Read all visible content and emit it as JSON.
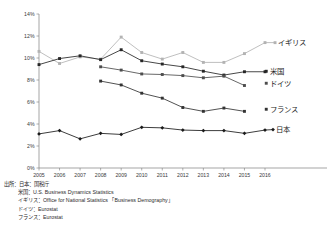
{
  "chart_data": {
    "type": "line",
    "title": "",
    "subtitle": "",
    "xlabel": "",
    "ylabel": "",
    "x": [
      2005,
      2006,
      2007,
      2008,
      2009,
      2010,
      2011,
      2012,
      2013,
      2014,
      2015,
      2016
    ],
    "xtick_labels": [
      "2005",
      "2006",
      "2007",
      "2008",
      "2009",
      "2010",
      "2011",
      "2012",
      "2013",
      "2014",
      "2015",
      "2016"
    ],
    "ytick_labels": [
      "0%",
      "2%",
      "4%",
      "6%",
      "8%",
      "10%",
      "12%",
      "14%"
    ],
    "ytick_values": [
      0,
      2,
      4,
      6,
      8,
      10,
      12,
      14
    ],
    "ylim": [
      0,
      14
    ],
    "xlim": [
      2005,
      2016
    ],
    "grid": false,
    "legend_position": "right-inline-labels",
    "series": [
      {
        "name": "イギリス",
        "label": "イギリス",
        "color": "#b3b3b3",
        "marker": "square",
        "x": [
          2005,
          2006,
          2007,
          2008,
          2009,
          2010,
          2011,
          2012,
          2013,
          2014,
          2015,
          2016
        ],
        "values": [
          10.6,
          9.5,
          10.1,
          9.9,
          11.9,
          10.5,
          9.9,
          10.5,
          9.6,
          9.6,
          10.4,
          11.4
        ]
      },
      {
        "name": "米国",
        "label": "米国",
        "color": "#262626",
        "marker": "square",
        "x": [
          2005,
          2006,
          2007,
          2008,
          2009,
          2010,
          2011,
          2012,
          2013,
          2014,
          2015,
          2016
        ],
        "values": [
          9.4,
          9.95,
          10.2,
          9.85,
          10.75,
          9.75,
          9.45,
          9.2,
          8.8,
          8.45,
          8.75,
          8.75
        ]
      },
      {
        "name": "ドイツ",
        "label": "ドイツ",
        "color": "#4d4d4d",
        "marker": "square",
        "x": [
          2008,
          2009,
          2010,
          2011,
          2012,
          2013,
          2014,
          2015
        ],
        "values": [
          9.2,
          8.9,
          8.55,
          8.5,
          8.4,
          8.2,
          8.35,
          7.5
        ]
      },
      {
        "name": "フランス",
        "label": "フランス",
        "color": "#333333",
        "marker": "square",
        "x": [
          2008,
          2009,
          2010,
          2011,
          2012,
          2013,
          2014,
          2015
        ],
        "values": [
          7.9,
          7.55,
          6.8,
          6.35,
          5.5,
          5.15,
          5.45,
          5.15
        ]
      },
      {
        "name": "日本",
        "label": "日本",
        "color": "#1a1a1a",
        "marker": "diamond",
        "x": [
          2005,
          2006,
          2007,
          2008,
          2009,
          2010,
          2011,
          2012,
          2013,
          2014,
          2015,
          2016
        ],
        "values": [
          3.1,
          3.4,
          2.65,
          3.15,
          3.05,
          3.7,
          3.65,
          3.45,
          3.4,
          3.4,
          3.15,
          3.45
        ]
      }
    ]
  },
  "source": {
    "heading": "出所：日本：国税庁",
    "lines": [
      "米国：U.S. Business Dynamics Statistics",
      "イギリス：Office for National Statistics 「Business Demography」",
      "ドイツ：Eurostat",
      "フランス：Eurostat"
    ]
  }
}
